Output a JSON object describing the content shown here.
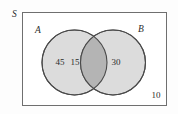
{
  "figure": {
    "type": "venn-diagram",
    "universe_label": "S",
    "set_a_label": "A",
    "set_b_label": "B",
    "counts": {
      "a_only": "45",
      "intersection": "15",
      "b_only": "30",
      "outside": "10"
    },
    "colors": {
      "circle_fill": "#dcdcdc",
      "intersection_fill": "#b4b4b4",
      "stroke": "#4a4a4a",
      "rect_stroke": "#6f6f6f",
      "rect_fill": "#ffffff",
      "text": "#2b2b2b",
      "page_background": "#fdfdfd"
    },
    "geometry": {
      "rect": {
        "x": 22,
        "y": 12,
        "width": 144,
        "height": 94
      },
      "circle_a": {
        "cx": 74.5,
        "cy": 62.5,
        "r": 32.5
      },
      "circle_b": {
        "cx": 113,
        "cy": 62.5,
        "r": 32.5
      }
    }
  }
}
